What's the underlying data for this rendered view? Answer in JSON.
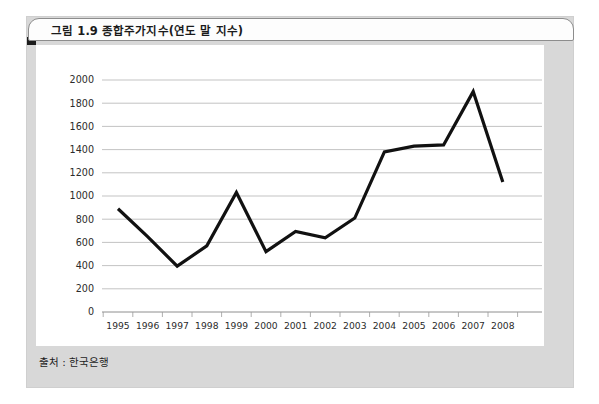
{
  "figure": {
    "title": "그림 1.9  종합주가지수(연도 말 지수)",
    "source": "출처 : 한국은행"
  },
  "colors": {
    "line": "#111111",
    "grid": "#b4b4b4",
    "axis": "#8e8e8e",
    "panel": "#d8d8d8",
    "canvas": "#ffffff",
    "accent": "#1c1c1c"
  },
  "chart_data": {
    "type": "line",
    "title": "종합주가지수(연도 말 지수)",
    "xlabel": "",
    "ylabel": "",
    "categories": [
      "1995",
      "1996",
      "1997",
      "1998",
      "1999",
      "2000",
      "2001",
      "2002",
      "2003",
      "2004",
      "2005",
      "2006",
      "2007",
      "2008"
    ],
    "values": [
      890,
      650,
      395,
      570,
      1030,
      520,
      695,
      640,
      810,
      1380,
      1430,
      1440,
      1900,
      1120
    ],
    "series": [
      {
        "name": "종합주가지수",
        "values": [
          890,
          650,
          395,
          570,
          1030,
          520,
          695,
          640,
          810,
          1380,
          1430,
          1440,
          1900,
          1120
        ]
      }
    ],
    "ylim": [
      0,
      2000
    ],
    "yticks": [
      0,
      200,
      400,
      600,
      800,
      1000,
      1200,
      1400,
      1600,
      1800,
      2000
    ],
    "ytick_labels": [
      "0",
      "200",
      "400",
      "600",
      "800",
      "1000",
      "1200",
      "1400",
      "1600",
      "1800",
      "2000"
    ],
    "xtick_labels": [
      "1995",
      "1996",
      "1997",
      "1998",
      "1999",
      "2000",
      "2001",
      "2002",
      "2003",
      "2004",
      "2005",
      "2006",
      "2007",
      "2008"
    ],
    "grid": true,
    "grid_axis": "y",
    "legend": false,
    "legend_position": "none",
    "markers": false
  }
}
